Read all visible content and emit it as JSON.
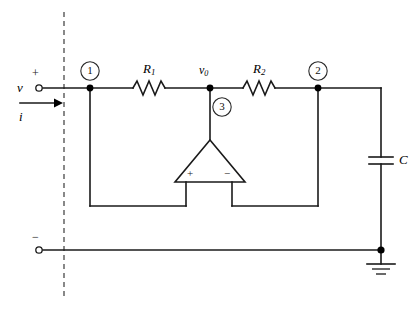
{
  "figure": {
    "type": "circuit-schematic",
    "background_color": "#ffffff",
    "line_color": "#1a1a1a"
  },
  "terminals": {
    "input_voltage_label": "v",
    "input_current_label": "i",
    "plus_sign": "+",
    "minus_sign": "−"
  },
  "nodes": [
    {
      "id": "node-1",
      "label": "1"
    },
    {
      "id": "node-2",
      "label": "2"
    },
    {
      "id": "node-3",
      "label": "3"
    }
  ],
  "components": {
    "resistor_1": {
      "label": "R",
      "subscript": "1"
    },
    "resistor_2": {
      "label": "R",
      "subscript": "2"
    },
    "capacitor": {
      "label": "C"
    },
    "opamp": {
      "plus_input": "+",
      "minus_input": "−"
    },
    "output_node": {
      "label": "v",
      "subscript": "0"
    },
    "ground": {
      "label": ""
    }
  }
}
